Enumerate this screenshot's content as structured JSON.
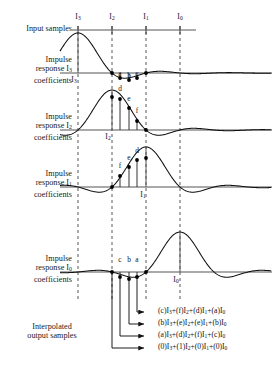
{
  "figure": {
    "axis_color": "#555555",
    "curve_color": "#111111",
    "dash_color": "#444444",
    "dot_color": "#000000"
  },
  "row_labels": {
    "input_samples": "Input samples",
    "impulse_i3_line1": "Impulse",
    "impulse_i3_line2": "response I",
    "impulse_i3_sub": "3",
    "impulse_i3_line3": "coefficients",
    "impulse_i2_line1": "Impulse",
    "impulse_i2_line2": "response I",
    "impulse_i2_sub": "2",
    "impulse_i2_line3": "coefficients",
    "impulse_i1_line1": "Impulse",
    "impulse_i1_line2": "response I",
    "impulse_i1_sub": "1",
    "impulse_i1_line3": "coefficients",
    "impulse_i0_line1": "Impulse",
    "impulse_i0_line2": "response I",
    "impulse_i0_sub": "0",
    "impulse_i0_line3": "coefficients",
    "interpolated_line1": "Interpolated",
    "interpolated_line2": "output samples"
  },
  "sample_ticks": [
    {
      "name": "I3",
      "base": "I",
      "sub": "3",
      "x": 78
    },
    {
      "name": "I2",
      "base": "I",
      "sub": "2",
      "x": 112
    },
    {
      "name": "I1",
      "base": "I",
      "sub": "1",
      "x": 146
    },
    {
      "name": "I0",
      "base": "I",
      "sub": "0",
      "x": 180
    }
  ],
  "panels": [
    {
      "id": "impulse-response-i3",
      "peak_tick": "I3",
      "peak_x": 78,
      "baseline_y": 73,
      "inline_tick": {
        "base": "I",
        "sub": "3",
        "x": 74,
        "y": 75
      },
      "coefficients": [
        {
          "label": "a",
          "x": 120,
          "y": 78
        },
        {
          "label": "b",
          "x": 129,
          "y": 80
        },
        {
          "label": "c",
          "x": 137,
          "y": 78
        }
      ],
      "dots": [
        {
          "x": 112,
          "y": 73
        },
        {
          "x": 120,
          "y": 78
        },
        {
          "x": 129,
          "y": 80
        },
        {
          "x": 137,
          "y": 78
        },
        {
          "x": 146,
          "y": 73
        }
      ]
    },
    {
      "id": "impulse-response-i2",
      "peak_tick": "I2",
      "peak_x": 112,
      "baseline_y": 130,
      "inline_tick": {
        "base": "I",
        "sub": "2",
        "x": 108,
        "y": 132
      },
      "coefficients": [
        {
          "label": "d",
          "x": 120,
          "y": 93
        },
        {
          "label": "e",
          "x": 129,
          "y": 103
        },
        {
          "label": "f",
          "x": 137,
          "y": 115
        }
      ],
      "dots": [
        {
          "x": 112,
          "y": 97
        },
        {
          "x": 120,
          "y": 99
        },
        {
          "x": 129,
          "y": 108
        },
        {
          "x": 137,
          "y": 121
        },
        {
          "x": 146,
          "y": 130
        }
      ]
    },
    {
      "id": "impulse-response-i1",
      "peak_tick": "I1",
      "peak_x": 146,
      "baseline_y": 187,
      "inline_tick": {
        "base": "I",
        "sub": "1",
        "x": 143,
        "y": 190
      },
      "coefficients": [
        {
          "label": "f",
          "x": 120,
          "y": 170
        },
        {
          "label": "e",
          "x": 129,
          "y": 162
        },
        {
          "label": "d",
          "x": 137,
          "y": 155
        }
      ],
      "dots": [
        {
          "x": 112,
          "y": 187
        },
        {
          "x": 120,
          "y": 176
        },
        {
          "x": 129,
          "y": 167
        },
        {
          "x": 137,
          "y": 160
        },
        {
          "x": 146,
          "y": 158
        }
      ]
    },
    {
      "id": "impulse-response-i0",
      "peak_tick": "I0",
      "peak_x": 180,
      "baseline_y": 272,
      "inline_tick": {
        "base": "I",
        "sub": "0",
        "x": 176,
        "y": 275
      },
      "coefficients": [
        {
          "label": "c",
          "x": 120,
          "y": 264
        },
        {
          "label": "b",
          "x": 129,
          "y": 264
        },
        {
          "label": "a",
          "x": 137,
          "y": 264
        }
      ],
      "dots": [
        {
          "x": 112,
          "y": 272
        },
        {
          "x": 120,
          "y": 277
        },
        {
          "x": 129,
          "y": 279
        },
        {
          "x": 137,
          "y": 277
        },
        {
          "x": 146,
          "y": 272
        }
      ]
    }
  ],
  "output_equations": [
    {
      "id": "eq-1",
      "source_x": 137,
      "arrow_y": 312,
      "terms": [
        {
          "coef": "c",
          "sample": "I",
          "sub": "3"
        },
        {
          "coef": "f",
          "sample": "I",
          "sub": "2"
        },
        {
          "coef": "d",
          "sample": "I",
          "sub": "1"
        },
        {
          "coef": "a",
          "sample": "I",
          "sub": "0"
        }
      ]
    },
    {
      "id": "eq-2",
      "source_x": 129,
      "arrow_y": 324,
      "terms": [
        {
          "coef": "b",
          "sample": "I",
          "sub": "3"
        },
        {
          "coef": "e",
          "sample": "I",
          "sub": "2"
        },
        {
          "coef": "e",
          "sample": "I",
          "sub": "1"
        },
        {
          "coef": "b",
          "sample": "I",
          "sub": "0"
        }
      ]
    },
    {
      "id": "eq-3",
      "source_x": 120,
      "arrow_y": 336,
      "terms": [
        {
          "coef": "a",
          "sample": "I",
          "sub": "3"
        },
        {
          "coef": "d",
          "sample": "I",
          "sub": "2"
        },
        {
          "coef": "f",
          "sample": "I",
          "sub": "1"
        },
        {
          "coef": "c",
          "sample": "I",
          "sub": "0"
        }
      ]
    },
    {
      "id": "eq-4",
      "source_x": 112,
      "arrow_y": 348,
      "terms": [
        {
          "coef": "0",
          "sample": "I",
          "sub": "3"
        },
        {
          "coef": "1",
          "sample": "I",
          "sub": "2"
        },
        {
          "coef": "0",
          "sample": "I",
          "sub": "1"
        },
        {
          "coef": "0",
          "sample": "I",
          "sub": "0"
        }
      ]
    }
  ]
}
